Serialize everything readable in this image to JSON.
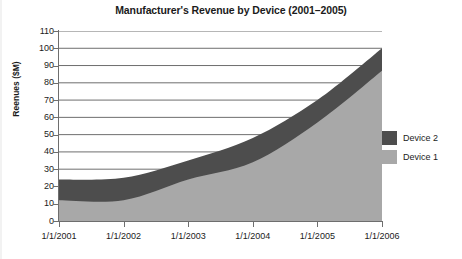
{
  "chart_data": {
    "type": "area",
    "stacked": true,
    "title": "Manufacturer's Revenue by Device (2001–2005)",
    "xlabel": "",
    "ylabel": "Reenues ($M)",
    "x": [
      "1/1/2001",
      "1/1/2002",
      "1/1/2003",
      "1/1/2004",
      "1/1/2005",
      "1/1/2006"
    ],
    "categories": [
      "1/1/2001",
      "1/1/2002",
      "1/1/2003",
      "1/1/2004",
      "1/1/2005",
      "1/1/2006"
    ],
    "series": [
      {
        "name": "Device 1",
        "color": "#a8a8a8",
        "values": [
          12,
          12,
          24,
          34,
          57,
          87
        ]
      },
      {
        "name": "Device 2",
        "color": "#4d4d4d",
        "values": [
          12,
          13,
          11,
          14,
          13,
          13
        ]
      }
    ],
    "cumulative_top": [
      24,
      25,
      35,
      48,
      70,
      100
    ],
    "ylim": [
      0,
      110
    ],
    "yticks": [
      0,
      10,
      20,
      30,
      40,
      50,
      60,
      70,
      80,
      90,
      100,
      110
    ],
    "ytick_labels": [
      "0",
      "10",
      "20",
      "30",
      "40",
      "50",
      "60",
      "70",
      "80",
      "90",
      "100",
      "110"
    ],
    "grid": true,
    "grid_axis": "y",
    "legend_position": "right",
    "legend_entries": [
      "Device 2",
      "Device 1"
    ]
  },
  "legend": {
    "items": [
      {
        "label": "Device 2",
        "color": "#4d4d4d"
      },
      {
        "label": "Device 1",
        "color": "#a8a8a8"
      }
    ]
  },
  "colors": {
    "device_1": "#a8a8a8",
    "device_2": "#4d4d4d",
    "axis": "#6e6e6e",
    "grid": "#6e6e6e",
    "text": "#1b1b1b",
    "background": "#ffffff"
  }
}
